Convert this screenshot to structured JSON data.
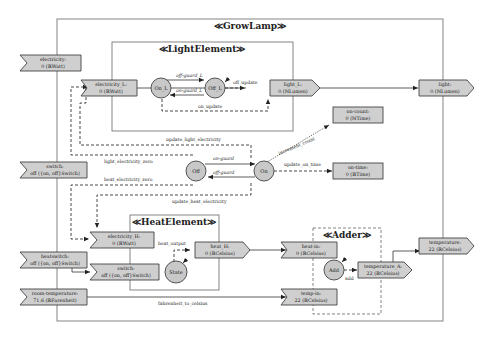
{
  "diagram": {
    "containers": {
      "growlamp": "≪GrowLamp≫",
      "light_element": "≪LightElement≫",
      "heat_element": "≪HeatElement≫",
      "adder": "≪Adder≫"
    },
    "inputs": {
      "electricity": [
        "electricity:",
        "0 (ℝWatt)"
      ],
      "switch": [
        "switch:",
        "off ({on, off}Switch)"
      ],
      "heatswitch": [
        "heatswitch:",
        "off ({on, off}Switch)"
      ],
      "room_temperature": [
        "room-temperature:",
        "71.6 (ℝFarenheit)"
      ]
    },
    "outputs": {
      "light": [
        "light:",
        "0 (ℕLumen)"
      ],
      "temperature": [
        "temperature:",
        "22 (ℝCelsius)"
      ]
    },
    "internal_ports": {
      "electricity_L": [
        "electricity_L:",
        "0 (ℝWatt)"
      ],
      "light_L": [
        "light_L:",
        "0 (ℕLumen)"
      ],
      "on_count": [
        "on-count:",
        "0 (ℕTime)"
      ],
      "on_time": [
        "on-time:",
        "0 (ℝTime)"
      ],
      "electricity_H": [
        "electricity_H:",
        "0 (ℝWatt)"
      ],
      "switch_H": [
        "switch:",
        "off ({on, off}Switch)"
      ],
      "heat_H": [
        "heat_H:",
        "0 (ℝCelsius)"
      ],
      "heat_in": [
        "heat-in:",
        "0 (ℝCelsius)"
      ],
      "temp_in": [
        "temp-in:",
        "22 (ℝCelsius)"
      ],
      "temperature_A": [
        "temperature_A:",
        "22 (ℝCelsius)"
      ]
    },
    "states": {
      "on_L": "On_L",
      "off_L": "Off_L",
      "off": "Off",
      "on": "On",
      "state": "State",
      "add": "Add"
    },
    "transitions": {
      "off_guard_L": "off-guard_L",
      "on_guard_L": "on-guard_L",
      "on_guard": "on-guard",
      "off_guard": "off-guard"
    },
    "updates": {
      "off_update": "off_update",
      "on_update": "on_update",
      "update_light_electricity": "update_light_electricity",
      "light_electricity_zero": "light_electricity_zero",
      "heat_electricity_zero": "heat_electricity_zero",
      "update_heat_electricity": "update_heat_electricity",
      "increment_count": "increment_count",
      "update_on_time": "update_on_time",
      "heat_output": "heat_output",
      "add": "add",
      "fahrenheit_to_celsius": "fahrenheit_to_celsius"
    }
  }
}
